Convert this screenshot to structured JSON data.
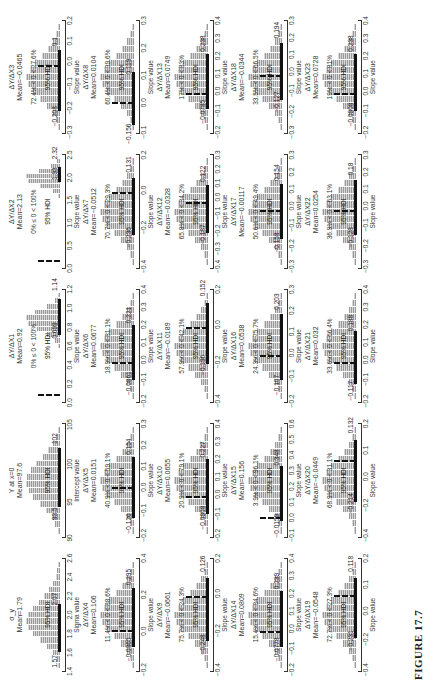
{
  "figure": {
    "label": "FIGURE 17.7",
    "orientation": "rotated 90 degrees counter-clockwise"
  },
  "chart_data": {
    "type": "histogram-grid",
    "title": "FIGURE 17.7",
    "grid": {
      "rows": 5,
      "cols": 5
    },
    "panels": [
      {
        "title": "σ_y",
        "mean": "Mean=1.79",
        "pct": "",
        "hdi_label": "95% HDI",
        "hdi_low": "1.57",
        "hdi_high": "2.07",
        "xlabel": "Sigma value",
        "ticks": [
          "1.4",
          "1.6",
          "1.8",
          "2.0",
          "2.2",
          "2.4",
          "2.6"
        ],
        "bars": [
          2,
          4,
          8,
          14,
          22,
          30,
          36,
          38,
          36,
          30,
          24,
          18,
          12,
          8,
          5,
          3,
          2
        ],
        "hdi": [
          0.15,
          0.6
        ],
        "zero": null
      },
      {
        "title": "Y at x=0",
        "mean": "Mean=97.6",
        "pct": "",
        "hdi_label": "95% HDI",
        "hdi_low": "93.5",
        "hdi_high": "102",
        "xlabel": "Intercept value",
        "ticks": [
          "90",
          "95",
          "100",
          "105"
        ],
        "bars": [
          2,
          5,
          9,
          15,
          22,
          29,
          34,
          37,
          36,
          32,
          26,
          19,
          13,
          8,
          4,
          2
        ],
        "hdi": [
          0.25,
          0.8
        ],
        "zero": null
      },
      {
        "title": "ΔY/ΔX1",
        "mean": "Mean=0.92",
        "pct": "0% ≤ 0 < 100%",
        "hdi_label": "95% HDI",
        "hdi_low": "0.699",
        "hdi_high": "1.14",
        "xlabel": "Slope value",
        "ticks": [
          "0.0",
          "0.2",
          "0.4",
          "0.6",
          "0.8",
          "1.0",
          "1.2"
        ],
        "bars": [
          0,
          0,
          0,
          0,
          0,
          0,
          0,
          0,
          0,
          2,
          6,
          14,
          26,
          36,
          38,
          28,
          14,
          6,
          2
        ],
        "hdi": [
          0.6,
          0.94
        ],
        "zero": 0.03
      },
      {
        "title": "ΔY/ΔX2",
        "mean": "Mean=2.13",
        "pct": "0% ≤ 0 < 100%",
        "hdi_label": "95% HDI",
        "hdi_low": "1.93",
        "hdi_high": "2.32",
        "xlabel": "Slope value",
        "ticks": [
          "0.0",
          "0.5",
          "1.0",
          "1.5",
          "2.0",
          "2.5"
        ],
        "bars": [
          0,
          0,
          0,
          0,
          0,
          0,
          0,
          0,
          0,
          0,
          0,
          0,
          0,
          2,
          8,
          22,
          36,
          38,
          24,
          10,
          3
        ],
        "hdi": [
          0.78,
          0.92
        ],
        "zero": 0.03
      },
      {
        "title": "ΔY/ΔX3",
        "mean": "Mean=−0.0465",
        "pct": "72.4% < 0 < 27.6%",
        "hdi_label": "95% HDI",
        "hdi_low": "−0.208",
        "hdi_high": "0.1",
        "xlabel": "Slope value",
        "ticks": [
          "−0.3",
          "−0.2",
          "−0.1",
          "0.0",
          "0.1",
          "0.2"
        ],
        "bars": [
          2,
          4,
          8,
          14,
          22,
          30,
          36,
          38,
          34,
          28,
          20,
          13,
          8,
          4,
          2
        ],
        "hdi": [
          0.18,
          0.76
        ],
        "zero": 0.6
      },
      {
        "title": "ΔY/ΔX4",
        "mean": "Mean=0.106",
        "pct": "11.4% < 0 < 88.6%",
        "hdi_label": "95% HDI",
        "hdi_low": "−0.0865",
        "hdi_high": "0.295",
        "xlabel": "Slope value",
        "ticks": [
          "−0.2",
          "0.0",
          "0.2",
          "0.4"
        ],
        "bars": [
          2,
          4,
          8,
          14,
          22,
          30,
          36,
          38,
          34,
          28,
          20,
          13,
          8,
          4,
          2
        ],
        "hdi": [
          0.2,
          0.75
        ],
        "zero": 0.34
      },
      {
        "title": "ΔY/ΔX5",
        "mean": "Mean=0.0151",
        "pct": "40.9% < 0 < 59.1%",
        "hdi_label": "95% HDI",
        "hdi_low": "−0.126",
        "hdi_high": "0.154",
        "xlabel": "Slope value",
        "ticks": [
          "−0.2",
          "−0.1",
          "0.0",
          "0.1",
          "0.2",
          "0.3"
        ],
        "bars": [
          2,
          4,
          8,
          14,
          22,
          30,
          36,
          38,
          34,
          28,
          20,
          13,
          8,
          4,
          2
        ],
        "hdi": [
          0.15,
          0.72
        ],
        "zero": 0.42
      },
      {
        "title": "ΔY/ΔX6",
        "mean": "Mean=0.0677",
        "pct": "18.9% < 0 < 81.1%",
        "hdi_label": "95% HDI",
        "hdi_low": "−0.0861",
        "hdi_high": "0.221",
        "xlabel": "Slope value",
        "ticks": [
          "−0.2",
          "−0.1",
          "0.0",
          "0.1",
          "0.2",
          "0.3",
          "0.4"
        ],
        "bars": [
          2,
          4,
          8,
          14,
          22,
          30,
          36,
          38,
          34,
          28,
          20,
          13,
          8,
          4,
          2
        ],
        "hdi": [
          0.18,
          0.7
        ],
        "zero": 0.33
      },
      {
        "title": "ΔY/ΔX7",
        "mean": "Mean=−0.0512",
        "pct": "70.7% < 0 < 29.3%",
        "hdi_label": "95% HDI",
        "hdi_low": "−0.236",
        "hdi_high": "0.131",
        "xlabel": "Slope value",
        "ticks": [
          "−0.4",
          "−0.2",
          "0.0",
          "0.2"
        ],
        "bars": [
          2,
          4,
          8,
          14,
          22,
          30,
          36,
          38,
          34,
          28,
          20,
          13,
          8,
          4,
          2
        ],
        "hdi": [
          0.28,
          0.82
        ],
        "zero": 0.67
      },
      {
        "title": "ΔY/ΔX8",
        "mean": "Mean=0.0104",
        "pct": "60.4% < 0 < 39.6%",
        "hdi_label": "95% HDI",
        "hdi_low": "−0.156",
        "hdi_high": "0.119",
        "xlabel": "Slope value",
        "ticks": [
          "−0.1",
          "0.0",
          "0.1",
          "0.2",
          "0.3"
        ],
        "bars": [
          2,
          4,
          8,
          14,
          22,
          30,
          36,
          38,
          34,
          28,
          20,
          13,
          8,
          4,
          2
        ],
        "hdi": [
          0.05,
          0.55
        ],
        "zero": 0.25
      },
      {
        "title": "ΔY/ΔX9",
        "mean": "Mean=−0.0661",
        "pct": "75.7% < 0 < 24.3%",
        "hdi_label": "95% HDI",
        "hdi_low": "−0.248",
        "hdi_high": "0.126",
        "xlabel": "Slope value",
        "ticks": [
          "−0.4",
          "−0.2",
          "0.0",
          "0.2"
        ],
        "bars": [
          2,
          4,
          8,
          14,
          22,
          30,
          36,
          38,
          34,
          28,
          20,
          13,
          8,
          4,
          2
        ],
        "hdi": [
          0.25,
          0.85
        ],
        "zero": 0.66
      },
      {
        "title": "ΔY/ΔX10",
        "mean": "Mean=0.0655",
        "pct": "20.9% < 0 < 79.1%",
        "hdi_label": "95% HDI",
        "hdi_low": "−0.0908",
        "hdi_high": "0.227",
        "xlabel": "Slope value",
        "ticks": [
          "−0.2",
          "−0.1",
          "0.0",
          "0.1",
          "0.2",
          "0.3",
          "0.4"
        ],
        "bars": [
          2,
          4,
          8,
          14,
          22,
          30,
          36,
          38,
          34,
          28,
          20,
          13,
          8,
          4,
          2
        ],
        "hdi": [
          0.18,
          0.7
        ],
        "zero": 0.33
      },
      {
        "title": "ΔY/ΔX11",
        "mean": "Mean=−0.0189",
        "pct": "57.9% < 0 < 42.1%",
        "hdi_label": "95% HDI",
        "hdi_low": "−0.196",
        "hdi_high": "0.152",
        "xlabel": "Slope value",
        "ticks": [
          "−0.4",
          "−0.2",
          "0.0",
          "0.2"
        ],
        "bars": [
          2,
          4,
          8,
          14,
          22,
          30,
          36,
          38,
          34,
          28,
          20,
          13,
          8,
          4,
          2
        ],
        "hdi": [
          0.33,
          0.9
        ],
        "zero": 0.66
      },
      {
        "title": "ΔY/ΔX12",
        "mean": "Mean=−0.0328",
        "pct": "65.8% < 0 < 34.2%",
        "hdi_label": "95% HDI",
        "hdi_low": "−0.187",
        "hdi_high": "0.122",
        "xlabel": "Slope value",
        "ticks": [
          "−0.4",
          "−0.3",
          "−0.2",
          "−0.1",
          "0.0",
          "0.1",
          "0.2",
          "0.3"
        ],
        "bars": [
          2,
          4,
          8,
          14,
          22,
          30,
          36,
          38,
          34,
          28,
          20,
          13,
          8,
          4,
          2
        ],
        "hdi": [
          0.3,
          0.75
        ],
        "zero": 0.57
      },
      {
        "title": "ΔY/ΔX13",
        "mean": "Mean=0.0749",
        "pct": "17% < 0 < 83%",
        "hdi_label": "95% HDI",
        "hdi_low": "−0.0785",
        "hdi_high": "0.238",
        "xlabel": "Slope value",
        "ticks": [
          "−0.2",
          "−0.1",
          "0.0",
          "0.1",
          "0.2",
          "0.3",
          "0.4"
        ],
        "bars": [
          2,
          4,
          8,
          14,
          22,
          30,
          36,
          38,
          34,
          28,
          20,
          13,
          8,
          4,
          2
        ],
        "hdi": [
          0.2,
          0.72
        ],
        "zero": 0.33
      },
      {
        "title": "ΔY/ΔX14",
        "mean": "Mean=0.0809",
        "pct": "15.4% < 0 < 84.6%",
        "hdi_label": "95% HDI",
        "hdi_low": "−0.0778",
        "hdi_high": "0.239",
        "xlabel": "Slope value",
        "ticks": [
          "−0.2",
          "−0.1",
          "0.0",
          "0.1",
          "0.2",
          "0.3",
          "0.4"
        ],
        "bars": [
          2,
          4,
          8,
          14,
          22,
          30,
          36,
          38,
          34,
          28,
          20,
          13,
          8,
          4,
          2
        ],
        "hdi": [
          0.2,
          0.72
        ],
        "zero": 0.33
      },
      {
        "title": "ΔY/ΔX15",
        "mean": "Mean=0.156",
        "pct": "3.9% < 0 < 96.1%",
        "hdi_label": "95% HDI",
        "hdi_low": "−0.0159",
        "hdi_high": "0.348",
        "xlabel": "Slope value",
        "ticks": [
          "−0.1",
          "0.0",
          "0.1",
          "0.2",
          "0.3",
          "0.4",
          "0.5",
          "0.6"
        ],
        "bars": [
          2,
          4,
          8,
          14,
          22,
          30,
          36,
          38,
          34,
          28,
          20,
          13,
          8,
          4,
          2
        ],
        "hdi": [
          0.12,
          0.64
        ],
        "zero": 0.14
      },
      {
        "title": "ΔY/ΔX16",
        "mean": "Mean=0.0538",
        "pct": "24.3% < 0 < 75.7%",
        "hdi_label": "95% HDI",
        "hdi_low": "−0.107",
        "hdi_high": "0.203",
        "xlabel": "Slope value",
        "ticks": [
          "−0.2",
          "−0.1",
          "0.0",
          "0.1",
          "0.2",
          "0.3"
        ],
        "bars": [
          2,
          4,
          8,
          14,
          22,
          30,
          36,
          38,
          34,
          28,
          20,
          13,
          8,
          4,
          2
        ],
        "hdi": [
          0.18,
          0.8
        ],
        "zero": 0.4
      },
      {
        "title": "ΔY/ΔX17",
        "mean": "Mean=−0.00117",
        "pct": "50.6% < 0 < 49.4%",
        "hdi_label": "95% HDI",
        "hdi_low": "−0.158",
        "hdi_high": "0.154",
        "xlabel": "Slope value",
        "ticks": [
          "−0.3",
          "−0.2",
          "−0.1",
          "0.0",
          "0.1",
          "0.2",
          "0.3"
        ],
        "bars": [
          2,
          4,
          8,
          14,
          22,
          30,
          36,
          38,
          34,
          28,
          20,
          13,
          8,
          4,
          2
        ],
        "hdi": [
          0.24,
          0.76
        ],
        "zero": 0.5
      },
      {
        "title": "ΔY/ΔX18",
        "mean": "Mean=−0.0344",
        "pct": "33.5% < 0 < 66.5%",
        "hdi_label": "95% HDI",
        "hdi_low": "−0.127",
        "hdi_high": "0.194",
        "xlabel": "Slope value",
        "ticks": [
          "−0.3",
          "−0.2",
          "−0.1",
          "0.0",
          "0.1",
          "0.2",
          "0.3"
        ],
        "bars": [
          2,
          4,
          8,
          14,
          22,
          30,
          36,
          38,
          34,
          28,
          20,
          13,
          8,
          4,
          2
        ],
        "hdi": [
          0.29,
          0.82
        ],
        "zero": 0.5
      },
      {
        "title": "ΔY/ΔX19",
        "mean": "Mean=−0.0548",
        "pct": "72.7% < 0 < 27.3%",
        "hdi_label": "95% HDI",
        "hdi_low": "−0.231",
        "hdi_high": "0.118",
        "xlabel": "Slope value",
        "ticks": [
          "−0.4",
          "−0.2",
          "0.0",
          "0.1",
          "0.2"
        ],
        "bars": [
          2,
          4,
          8,
          14,
          22,
          30,
          36,
          38,
          34,
          28,
          20,
          13,
          8,
          4,
          2
        ],
        "hdi": [
          0.28,
          0.85
        ],
        "zero": 0.67
      },
      {
        "title": "ΔY/ΔX20",
        "mean": "Mean=−0.0449",
        "pct": "68.9% < 0 < 31.1%",
        "hdi_label": "95% HDI",
        "hdi_low": "−0.214",
        "hdi_high": "0.132",
        "xlabel": "Slope value",
        "ticks": [
          "−0.4",
          "−0.2",
          "0.0",
          "0.1",
          "0.2"
        ],
        "bars": [
          2,
          4,
          8,
          14,
          22,
          30,
          36,
          38,
          34,
          28,
          20,
          13,
          8,
          4,
          2
        ],
        "hdi": [
          0.3,
          0.88
        ],
        "zero": 0.67
      },
      {
        "title": "ΔY/ΔX21",
        "mean": "Mean=0.032",
        "pct": "33.6% < 0 < 66.4%",
        "hdi_label": "95% HDI",
        "hdi_low": "−0.117",
        "hdi_high": "0.188",
        "xlabel": "Slope value",
        "ticks": [
          "−0.2",
          "−0.1",
          "0.0",
          "0.1",
          "0.2",
          "0.3",
          "0.4"
        ],
        "bars": [
          2,
          4,
          8,
          14,
          22,
          30,
          36,
          38,
          34,
          28,
          20,
          13,
          8,
          4,
          2
        ],
        "hdi": [
          0.14,
          0.64
        ],
        "zero": 0.33
      },
      {
        "title": "ΔY/ΔX22",
        "mean": "Mean=0.0254",
        "pct": "36.9% < 0 < 63.1%",
        "hdi_label": "95% HDI",
        "hdi_low": "−0.128",
        "hdi_high": "0.18",
        "xlabel": "Slope value",
        "ticks": [
          "−0.3",
          "−0.2",
          "−0.1",
          "0.0",
          "0.1",
          "0.2",
          "0.3"
        ],
        "bars": [
          2,
          4,
          8,
          14,
          22,
          30,
          36,
          38,
          34,
          28,
          20,
          13,
          8,
          4,
          2
        ],
        "hdi": [
          0.28,
          0.8
        ],
        "zero": 0.5
      },
      {
        "title": "ΔY/ΔX23",
        "mean": "Mean=0.0728",
        "pct": "19% < 0 < 81%",
        "hdi_label": "95% HDI",
        "hdi_low": "−0.0908",
        "hdi_high": "0.238",
        "xlabel": "Slope value",
        "ticks": [
          "−0.2",
          "−0.1",
          "0.0",
          "0.1",
          "0.2",
          "0.3",
          "0.4"
        ],
        "bars": [
          2,
          4,
          8,
          14,
          22,
          30,
          36,
          38,
          34,
          28,
          20,
          13,
          8,
          4,
          2
        ],
        "hdi": [
          0.18,
          0.72
        ],
        "zero": 0.33
      }
    ]
  }
}
